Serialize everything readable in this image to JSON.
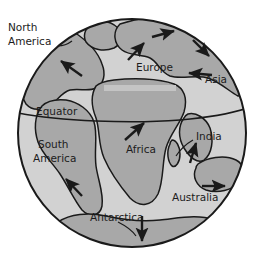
{
  "figure": {
    "background_color": "#ffffff"
  },
  "colors": {
    "background": "#ffffff",
    "ocean": "#d2d2d2",
    "land": "#a8a8a8",
    "outline": "#1a1a1a",
    "label_text": "#1c1c1c",
    "arrow": "#1a1a1a",
    "sea_band": "#c4c4c4"
  },
  "globe": {
    "center_x": 132,
    "center_y": 133,
    "radius": 114,
    "equator_label": "Equator"
  },
  "labels": [
    {
      "id": "north-america",
      "text_lines": [
        "North",
        "America"
      ],
      "x": 8,
      "y": 28,
      "has_leader": true
    },
    {
      "id": "europe",
      "text_lines": [
        "Europe"
      ],
      "x": 136,
      "y": 68,
      "has_leader": false
    },
    {
      "id": "asia",
      "text_lines": [
        "Asia"
      ],
      "x": 205,
      "y": 80,
      "has_leader": false
    },
    {
      "id": "equator",
      "text_lines": [
        "Equator"
      ],
      "x": 36,
      "y": 112,
      "has_leader": false
    },
    {
      "id": "south-america",
      "text_lines": [
        "South",
        "America"
      ],
      "x": 38,
      "y": 145,
      "has_leader": false
    },
    {
      "id": "africa",
      "text_lines": [
        "Africa"
      ],
      "x": 130,
      "y": 147,
      "has_leader": false
    },
    {
      "id": "india",
      "text_lines": [
        "India"
      ],
      "x": 196,
      "y": 137,
      "has_leader": true
    },
    {
      "id": "australia",
      "text_lines": [
        "Australia"
      ],
      "x": 172,
      "y": 196,
      "has_leader": false
    },
    {
      "id": "antarctica",
      "text_lines": [
        "Antarctica"
      ],
      "x": 92,
      "y": 216,
      "has_leader": true
    }
  ],
  "arrows": [
    {
      "id": "arrow-north-america",
      "direction": "up-left",
      "x1": 82,
      "y1": 76,
      "x2": 60,
      "y2": 60
    },
    {
      "id": "arrow-europe",
      "direction": "up-right",
      "x1": 128,
      "y1": 60,
      "x2": 145,
      "y2": 42
    },
    {
      "id": "arrow-north-atlantic",
      "direction": "right",
      "x1": 152,
      "y1": 37,
      "x2": 175,
      "y2": 30
    },
    {
      "id": "arrow-north-asia",
      "direction": "down-right",
      "x1": 193,
      "y1": 40,
      "x2": 210,
      "y2": 57
    },
    {
      "id": "arrow-asia",
      "direction": "left",
      "x1": 212,
      "y1": 75,
      "x2": 188,
      "y2": 73
    },
    {
      "id": "arrow-africa",
      "direction": "up-right",
      "x1": 125,
      "y1": 140,
      "x2": 145,
      "y2": 122
    },
    {
      "id": "arrow-india",
      "direction": "up",
      "x1": 190,
      "y1": 163,
      "x2": 196,
      "y2": 142
    },
    {
      "id": "arrow-australia",
      "direction": "right",
      "x1": 202,
      "y1": 186,
      "x2": 226,
      "y2": 186
    },
    {
      "id": "arrow-south-america",
      "direction": "up-left",
      "x1": 82,
      "y1": 196,
      "x2": 65,
      "y2": 178
    },
    {
      "id": "arrow-antarctica",
      "direction": "down",
      "x1": 142,
      "y1": 216,
      "x2": 142,
      "y2": 242
    }
  ],
  "landmasses": [
    {
      "id": "north-america",
      "name": "North America"
    },
    {
      "id": "eurasia",
      "name": "Eurasia"
    },
    {
      "id": "africa",
      "name": "Africa"
    },
    {
      "id": "south-america",
      "name": "South America"
    },
    {
      "id": "india",
      "name": "India"
    },
    {
      "id": "australia",
      "name": "Australia"
    },
    {
      "id": "antarctica",
      "name": "Antarctica"
    }
  ]
}
